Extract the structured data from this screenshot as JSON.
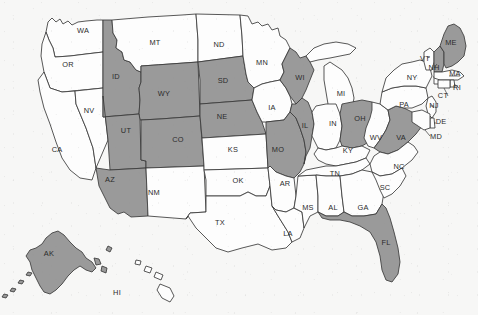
{
  "map": {
    "title": "United States choropleth map",
    "projection": "albers-usa",
    "legend_visible": false,
    "colors": {
      "highlighted": "#9a9a9a",
      "default": "#fdfdfd",
      "border": "#3a3a3a",
      "label": "#2b2b2b",
      "background": "#f7f7f6"
    },
    "highlighted_count": 16,
    "total_count": 51,
    "highlighted_states": [
      "ID",
      "WY",
      "UT",
      "CO",
      "AZ",
      "SD",
      "NE",
      "WI",
      "IL",
      "MO",
      "OH",
      "VA",
      "ME",
      "NH",
      "FL",
      "AK"
    ],
    "states": [
      {
        "code": "WA",
        "label": "WA",
        "highlighted": false,
        "lx": 83,
        "ly": 33
      },
      {
        "code": "OR",
        "label": "OR",
        "highlighted": false,
        "lx": 68,
        "ly": 67
      },
      {
        "code": "CA",
        "label": "CA",
        "highlighted": false,
        "lx": 57,
        "ly": 152
      },
      {
        "code": "NV",
        "label": "NV",
        "highlighted": false,
        "lx": 89,
        "ly": 113
      },
      {
        "code": "ID",
        "label": "ID",
        "highlighted": true,
        "lx": 116,
        "ly": 79
      },
      {
        "code": "MT",
        "label": "MT",
        "highlighted": false,
        "lx": 155,
        "ly": 45
      },
      {
        "code": "WY",
        "label": "WY",
        "highlighted": true,
        "lx": 164,
        "ly": 96
      },
      {
        "code": "UT",
        "label": "UT",
        "highlighted": true,
        "lx": 126,
        "ly": 133
      },
      {
        "code": "CO",
        "label": "CO",
        "highlighted": true,
        "lx": 178,
        "ly": 142
      },
      {
        "code": "AZ",
        "label": "AZ",
        "highlighted": true,
        "lx": 110,
        "ly": 182
      },
      {
        "code": "NM",
        "label": "NM",
        "highlighted": false,
        "lx": 154,
        "ly": 195
      },
      {
        "code": "ND",
        "label": "ND",
        "highlighted": false,
        "lx": 219,
        "ly": 47
      },
      {
        "code": "SD",
        "label": "SD",
        "highlighted": true,
        "lx": 223,
        "ly": 83
      },
      {
        "code": "NE",
        "label": "NE",
        "highlighted": true,
        "lx": 222,
        "ly": 119
      },
      {
        "code": "KS",
        "label": "KS",
        "highlighted": false,
        "lx": 233,
        "ly": 152
      },
      {
        "code": "OK",
        "label": "OK",
        "highlighted": false,
        "lx": 238,
        "ly": 183
      },
      {
        "code": "TX",
        "label": "TX",
        "highlighted": false,
        "lx": 220,
        "ly": 225
      },
      {
        "code": "MN",
        "label": "MN",
        "highlighted": false,
        "lx": 262,
        "ly": 65
      },
      {
        "code": "IA",
        "label": "IA",
        "highlighted": false,
        "lx": 272,
        "ly": 110
      },
      {
        "code": "MO",
        "label": "MO",
        "highlighted": true,
        "lx": 278,
        "ly": 152
      },
      {
        "code": "AR",
        "label": "AR",
        "highlighted": false,
        "lx": 285,
        "ly": 186
      },
      {
        "code": "LA",
        "label": "LA",
        "highlighted": false,
        "lx": 288,
        "ly": 236
      },
      {
        "code": "WI",
        "label": "WI",
        "highlighted": true,
        "lx": 300,
        "ly": 80
      },
      {
        "code": "IL",
        "label": "IL",
        "highlighted": true,
        "lx": 305,
        "ly": 128
      },
      {
        "code": "MS",
        "label": "MS",
        "highlighted": false,
        "lx": 308,
        "ly": 210
      },
      {
        "code": "MI",
        "label": "MI",
        "highlighted": false,
        "lx": 341,
        "ly": 96
      },
      {
        "code": "IN",
        "label": "IN",
        "highlighted": false,
        "lx": 333,
        "ly": 126
      },
      {
        "code": "KY",
        "label": "KY",
        "highlighted": false,
        "lx": 348,
        "ly": 153
      },
      {
        "code": "TN",
        "label": "TN",
        "highlighted": false,
        "lx": 335,
        "ly": 176
      },
      {
        "code": "AL",
        "label": "AL",
        "highlighted": false,
        "lx": 333,
        "ly": 210
      },
      {
        "code": "GA",
        "label": "GA",
        "highlighted": false,
        "lx": 363,
        "ly": 210
      },
      {
        "code": "OH",
        "label": "OH",
        "highlighted": true,
        "lx": 360,
        "ly": 121
      },
      {
        "code": "WV",
        "label": "WV",
        "highlighted": false,
        "lx": 376,
        "ly": 140
      },
      {
        "code": "VA",
        "label": "VA",
        "highlighted": true,
        "lx": 401,
        "ly": 140
      },
      {
        "code": "NC",
        "label": "NC",
        "highlighted": false,
        "lx": 399,
        "ly": 169
      },
      {
        "code": "SC",
        "label": "SC",
        "highlighted": false,
        "lx": 385,
        "ly": 190
      },
      {
        "code": "FL",
        "label": "FL",
        "highlighted": true,
        "lx": 386,
        "ly": 245
      },
      {
        "code": "PA",
        "label": "PA",
        "highlighted": false,
        "lx": 404,
        "ly": 107
      },
      {
        "code": "NY",
        "label": "NY",
        "highlighted": false,
        "lx": 412,
        "ly": 80
      },
      {
        "code": "VT",
        "label": "VT",
        "highlighted": false,
        "lx": 425,
        "ly": 61
      },
      {
        "code": "NH",
        "label": "NH",
        "highlighted": true,
        "lx": 434,
        "ly": 70
      },
      {
        "code": "ME",
        "label": "ME",
        "highlighted": true,
        "lx": 451,
        "ly": 45
      },
      {
        "code": "MA",
        "label": "MA",
        "highlighted": false,
        "lx": 455,
        "ly": 76
      },
      {
        "code": "RI",
        "label": "RI",
        "highlighted": false,
        "lx": 457,
        "ly": 90
      },
      {
        "code": "CT",
        "label": "CT",
        "highlighted": false,
        "lx": 443,
        "ly": 98
      },
      {
        "code": "NJ",
        "label": "NJ",
        "highlighted": false,
        "lx": 434,
        "ly": 108
      },
      {
        "code": "DE",
        "label": "DE",
        "highlighted": false,
        "lx": 441,
        "ly": 124
      },
      {
        "code": "MD",
        "label": "MD",
        "highlighted": false,
        "lx": 436,
        "ly": 139
      },
      {
        "code": "AK",
        "label": "AK",
        "highlighted": true,
        "lx": 49,
        "ly": 256
      },
      {
        "code": "HI",
        "label": "HI",
        "highlighted": false,
        "lx": 117,
        "ly": 295
      }
    ]
  }
}
